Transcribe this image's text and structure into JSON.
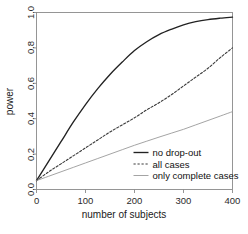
{
  "chart_data": {
    "type": "line",
    "title": "",
    "xlabel": "number of subjects",
    "ylabel": "power",
    "xlim": [
      0,
      400
    ],
    "ylim": [
      0,
      1
    ],
    "xticks": [
      "0",
      "100",
      "200",
      "300",
      "400"
    ],
    "xtick_values": [
      0,
      100,
      200,
      300,
      400
    ],
    "yticks": [
      "0.0",
      "0.2",
      "0.4",
      "0.6",
      "0.8",
      "1.0"
    ],
    "ytick_values": [
      0.0,
      0.2,
      0.4,
      0.6,
      0.8,
      1.0
    ],
    "grid": false,
    "legend_position": "lower-right-inside",
    "x": [
      0,
      25,
      50,
      75,
      100,
      125,
      150,
      175,
      200,
      225,
      250,
      275,
      300,
      325,
      350,
      375,
      400
    ],
    "series": [
      {
        "name": "no drop-out",
        "style": "solid",
        "color": "#222222",
        "values": [
          0.05,
          0.16,
          0.27,
          0.38,
          0.48,
          0.57,
          0.65,
          0.72,
          0.785,
          0.835,
          0.875,
          0.905,
          0.93,
          0.948,
          0.96,
          0.968,
          0.974
        ]
      },
      {
        "name": "all cases",
        "style": "dashed",
        "color": "#3a3a3a",
        "values": [
          0.05,
          0.1,
          0.145,
          0.19,
          0.235,
          0.28,
          0.325,
          0.365,
          0.405,
          0.45,
          0.49,
          0.535,
          0.585,
          0.635,
          0.685,
          0.745,
          0.8
        ]
      },
      {
        "name": "only complete cases",
        "style": "solid-light",
        "color": "#9a9a9a",
        "values": [
          0.05,
          0.075,
          0.1,
          0.125,
          0.15,
          0.175,
          0.2,
          0.225,
          0.25,
          0.273,
          0.296,
          0.318,
          0.34,
          0.365,
          0.39,
          0.415,
          0.44
        ]
      }
    ],
    "legend": [
      {
        "label": "no drop-out",
        "style": "solid",
        "color": "#222222"
      },
      {
        "label": "all cases",
        "style": "dashed",
        "color": "#3a3a3a"
      },
      {
        "label": "only complete cases",
        "style": "solid-light",
        "color": "#9a9a9a"
      }
    ],
    "axis_color": "#8a8a8a"
  }
}
